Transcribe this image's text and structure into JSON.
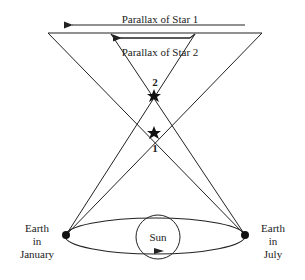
{
  "labels": {
    "parallax_star1": "Parallax of Star 1",
    "parallax_star2": "Parallax of Star 2",
    "star2_number": "2",
    "star1_number": "1",
    "earth_january": [
      "Earth",
      "in",
      "January"
    ],
    "earth_july": [
      "Earth",
      "in",
      "July"
    ],
    "sun": "Sun"
  },
  "colors": {
    "line": "#222222",
    "background": "#ffffff"
  }
}
